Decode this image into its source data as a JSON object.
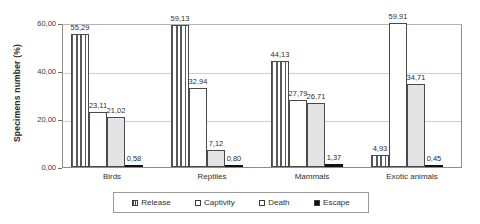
{
  "chart_data": {
    "type": "bar",
    "title": "",
    "xlabel": "",
    "ylabel": "Specimens number (%)",
    "ylim": [
      0,
      60
    ],
    "grid": true,
    "legend_position": "bottom",
    "decimal_separator": ",",
    "categories": [
      "Birds",
      "Reptiles",
      "Mammals",
      "Exotic animals"
    ],
    "ytick_labels": [
      "60,00",
      "40,00",
      "20,00",
      "0,00"
    ],
    "ytick_values": [
      60,
      40,
      20,
      0
    ],
    "series": [
      {
        "name": "Release",
        "pattern": "vertical-stripes",
        "values": [
          55.29,
          59.13,
          44.13,
          4.93
        ],
        "labels": [
          "55,29",
          "59,13",
          "44,13",
          "4,93"
        ]
      },
      {
        "name": "Captivity",
        "pattern": "white",
        "values": [
          23.11,
          32.94,
          27.79,
          59.91
        ],
        "labels": [
          "23,11",
          "32,94",
          "27,79",
          "59,91"
        ]
      },
      {
        "name": "Death",
        "pattern": "light-gray",
        "values": [
          21.02,
          7.12,
          26.71,
          34.71
        ],
        "labels": [
          "21,02",
          "7,12",
          "26,71",
          "34,71"
        ]
      },
      {
        "name": "Escape",
        "pattern": "black",
        "values": [
          0.58,
          0.8,
          1.37,
          0.45
        ],
        "labels": [
          "0,58",
          "0,80",
          "1,37",
          "0,45"
        ]
      }
    ]
  },
  "legend": {
    "items": [
      {
        "label": "Release"
      },
      {
        "label": "Captivity"
      },
      {
        "label": "Death"
      },
      {
        "label": "Escape"
      }
    ]
  }
}
